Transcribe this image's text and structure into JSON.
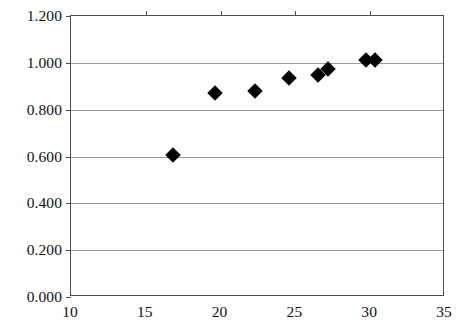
{
  "chart_data": {
    "type": "scatter",
    "title": "",
    "subtitle": "",
    "xlabel": "",
    "ylabel": "",
    "xlim": [
      10,
      35
    ],
    "ylim": [
      0.0,
      1.2
    ],
    "xticks": [
      10,
      15,
      20,
      25,
      30,
      35
    ],
    "yticks": [
      0.0,
      0.2,
      0.4,
      0.6,
      0.8,
      1.0,
      1.2
    ],
    "xtick_labels": [
      "10",
      "15",
      "20",
      "25",
      "30",
      "35"
    ],
    "ytick_labels": [
      "0.000",
      "0.200",
      "0.400",
      "0.600",
      "0.800",
      "1.000",
      "1.200"
    ],
    "grid": "horizontal",
    "legend": "none",
    "marker": "diamond",
    "marker_color": "#000000",
    "points": [
      {
        "x": 16.8,
        "y": 0.605
      },
      {
        "x": 19.6,
        "y": 0.87
      },
      {
        "x": 22.3,
        "y": 0.88
      },
      {
        "x": 24.6,
        "y": 0.935
      },
      {
        "x": 26.5,
        "y": 0.95
      },
      {
        "x": 27.2,
        "y": 0.975
      },
      {
        "x": 29.7,
        "y": 1.01
      },
      {
        "x": 30.3,
        "y": 1.01
      }
    ]
  }
}
